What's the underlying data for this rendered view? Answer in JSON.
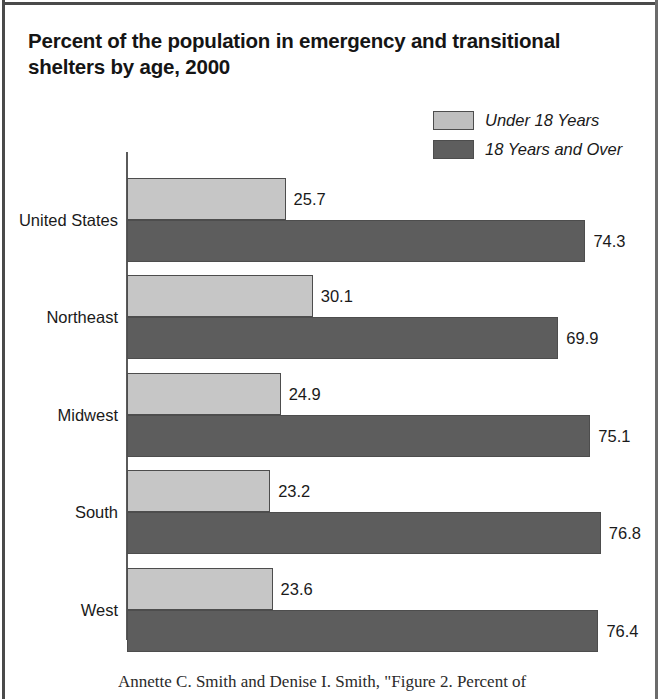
{
  "chart_data": {
    "type": "bar",
    "orientation": "horizontal",
    "title": "Percent of the population in emergency and transitional shelters by age, 2000",
    "title_line1": "Percent of the population in emergency and transitional",
    "title_line2": "shelters by age, 2000",
    "xlabel": "",
    "ylabel": "",
    "xlim": [
      0,
      80
    ],
    "grid": false,
    "legend_position": "top-right",
    "categories": [
      "United States",
      "Northeast",
      "Midwest",
      "South",
      "West"
    ],
    "series": [
      {
        "name": "Under 18 Years",
        "color": "#c6c6c6",
        "values": [
          25.7,
          30.1,
          24.9,
          23.2,
          23.6
        ]
      },
      {
        "name": "18 Years and Over",
        "color": "#5d5d5d",
        "values": [
          74.3,
          69.9,
          75.1,
          76.8,
          76.4
        ]
      }
    ],
    "data_labels": [
      {
        "category": "United States",
        "under18": "25.7",
        "over18": "74.3"
      },
      {
        "category": "Northeast",
        "under18": "30.1",
        "over18": "69.9"
      },
      {
        "category": "Midwest",
        "under18": "24.9",
        "over18": "75.1"
      },
      {
        "category": "South",
        "under18": "23.2",
        "over18": "76.8"
      },
      {
        "category": "West",
        "under18": "23.6",
        "over18": "76.4"
      }
    ]
  },
  "legend": {
    "items": [
      {
        "label": "Under 18 Years",
        "color": "#c6c6c6"
      },
      {
        "label": "18 Years and Over",
        "color": "#5d5d5d"
      }
    ]
  },
  "caption": {
    "text": "Annette C. Smith and Denise I. Smith, \"Figure 2. Percent of"
  }
}
